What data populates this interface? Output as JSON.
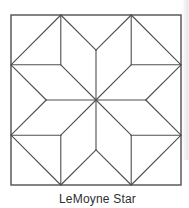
{
  "page": {
    "background": "#ffffff",
    "scan_shade_color": "rgba(120,120,115,0.18)"
  },
  "diagram": {
    "kind": "quilt-block-line-drawing",
    "caption": "LeMoyne Star",
    "line_color": "#4f4f4f",
    "border_line_width": 1.4,
    "seam_line_width": 1.1,
    "frame": {
      "x": 11,
      "y": 15,
      "size": 170
    },
    "point_inset_ratio": 0.29289,
    "apex_inset_ratio": 0.20711
  }
}
